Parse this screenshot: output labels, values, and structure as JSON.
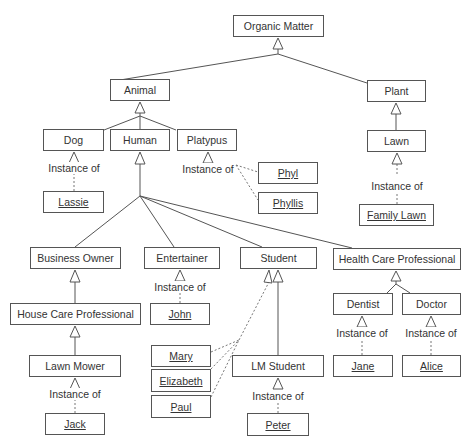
{
  "diagram": {
    "type": "UML class diagram",
    "instance_label": "Instance of",
    "classes": [
      {
        "id": "organic_matter",
        "label": "Organic Matter",
        "x": 233,
        "y": 15,
        "w": 91,
        "h": 22
      },
      {
        "id": "animal",
        "label": "Animal",
        "x": 110,
        "y": 79,
        "w": 60,
        "h": 22
      },
      {
        "id": "plant",
        "label": "Plant",
        "x": 367,
        "y": 80,
        "w": 59,
        "h": 22
      },
      {
        "id": "dog",
        "label": "Dog",
        "x": 43,
        "y": 129,
        "w": 61,
        "h": 22
      },
      {
        "id": "human",
        "label": "Human",
        "x": 110,
        "y": 129,
        "w": 60,
        "h": 22
      },
      {
        "id": "platypus",
        "label": "Platypus",
        "x": 177,
        "y": 129,
        "w": 60,
        "h": 22
      },
      {
        "id": "lawn",
        "label": "Lawn",
        "x": 367,
        "y": 130,
        "w": 59,
        "h": 22
      },
      {
        "id": "business_owner",
        "label": "Business Owner",
        "x": 30,
        "y": 247,
        "w": 91,
        "h": 22
      },
      {
        "id": "entertainer",
        "label": "Entertainer",
        "x": 144,
        "y": 247,
        "w": 76,
        "h": 22
      },
      {
        "id": "student",
        "label": "Student",
        "x": 240,
        "y": 247,
        "w": 77,
        "h": 22
      },
      {
        "id": "health_care_professional",
        "label": "Health Care Professional",
        "x": 333,
        "y": 248,
        "w": 128,
        "h": 22
      },
      {
        "id": "house_care_professional",
        "label": "House Care Professional",
        "x": 10,
        "y": 303,
        "w": 131,
        "h": 22
      },
      {
        "id": "dentist",
        "label": "Dentist",
        "x": 333,
        "y": 293,
        "w": 60,
        "h": 22
      },
      {
        "id": "doctor",
        "label": "Doctor",
        "x": 402,
        "y": 293,
        "w": 59,
        "h": 22
      },
      {
        "id": "lawn_mower",
        "label": "Lawn Mower",
        "x": 29,
        "y": 355,
        "w": 92,
        "h": 22
      },
      {
        "id": "lm_student",
        "label": "LM Student",
        "x": 232,
        "y": 355,
        "w": 92,
        "h": 22
      }
    ],
    "instances": [
      {
        "id": "lassie",
        "label": "Lassie",
        "x": 43,
        "y": 191,
        "w": 61,
        "h": 22
      },
      {
        "id": "phyl",
        "label": "Phyl",
        "x": 258,
        "y": 162,
        "w": 60,
        "h": 22
      },
      {
        "id": "phyllis",
        "label": "Phyllis",
        "x": 258,
        "y": 192,
        "w": 60,
        "h": 22
      },
      {
        "id": "family_lawn",
        "label": "Family Lawn",
        "x": 359,
        "y": 204,
        "w": 75,
        "h": 22
      },
      {
        "id": "john",
        "label": "John",
        "x": 150,
        "y": 303,
        "w": 60,
        "h": 22
      },
      {
        "id": "mary",
        "label": "Mary",
        "x": 151,
        "y": 345,
        "w": 60,
        "h": 22
      },
      {
        "id": "elizabeth",
        "label": "Elizabeth",
        "x": 151,
        "y": 369,
        "w": 60,
        "h": 23
      },
      {
        "id": "paul",
        "label": "Paul",
        "x": 151,
        "y": 395,
        "w": 60,
        "h": 23
      },
      {
        "id": "jane",
        "label": "Jane",
        "x": 333,
        "y": 355,
        "w": 60,
        "h": 22
      },
      {
        "id": "alice",
        "label": "Alice",
        "x": 402,
        "y": 355,
        "w": 59,
        "h": 22
      },
      {
        "id": "jack",
        "label": "Jack",
        "x": 45,
        "y": 413,
        "w": 60,
        "h": 22
      },
      {
        "id": "peter",
        "label": "Peter",
        "x": 247,
        "y": 413,
        "w": 62,
        "h": 23
      }
    ],
    "instance_labels": [
      {
        "of": "dog",
        "text": "Instance of",
        "x": 74,
        "y": 164
      },
      {
        "of": "platypus",
        "text": "Instance of",
        "x": 208,
        "y": 165
      },
      {
        "of": "lawn",
        "text": "Instance of",
        "x": 397,
        "y": 180
      },
      {
        "of": "entertainer",
        "text": "Instance of",
        "x": 180,
        "y": 282
      },
      {
        "of": "dentist",
        "text": "Instance of",
        "x": 362,
        "y": 328
      },
      {
        "of": "doctor",
        "text": "Instance of",
        "x": 431,
        "y": 328
      },
      {
        "of": "lawn_mower",
        "text": "Instance of",
        "x": 75,
        "y": 388
      },
      {
        "of": "lm_student",
        "text": "Instance of",
        "x": 278,
        "y": 390
      }
    ],
    "generalizations": [
      {
        "child": "animal",
        "parent": "organic_matter"
      },
      {
        "child": "plant",
        "parent": "organic_matter"
      },
      {
        "child": "dog",
        "parent": "animal"
      },
      {
        "child": "human",
        "parent": "animal"
      },
      {
        "child": "platypus",
        "parent": "animal"
      },
      {
        "child": "lawn",
        "parent": "plant"
      },
      {
        "child": "business_owner",
        "parent": "human"
      },
      {
        "child": "entertainer",
        "parent": "human"
      },
      {
        "child": "student",
        "parent": "human"
      },
      {
        "child": "health_care_professional",
        "parent": "human"
      },
      {
        "child": "house_care_professional",
        "parent": "business_owner"
      },
      {
        "child": "lawn_mower",
        "parent": "house_care_professional"
      },
      {
        "child": "lm_student",
        "parent": "student"
      },
      {
        "child": "dentist",
        "parent": "health_care_professional"
      },
      {
        "child": "doctor",
        "parent": "health_care_professional"
      }
    ],
    "instantiations": [
      {
        "instance": "lassie",
        "class": "dog"
      },
      {
        "instance": "phyl",
        "class": "platypus"
      },
      {
        "instance": "phyllis",
        "class": "platypus"
      },
      {
        "instance": "family_lawn",
        "class": "lawn"
      },
      {
        "instance": "john",
        "class": "entertainer"
      },
      {
        "instance": "mary",
        "class": "student"
      },
      {
        "instance": "elizabeth",
        "class": "student"
      },
      {
        "instance": "paul",
        "class": "student"
      },
      {
        "instance": "jane",
        "class": "dentist"
      },
      {
        "instance": "alice",
        "class": "doctor"
      },
      {
        "instance": "jack",
        "class": "lawn_mower"
      },
      {
        "instance": "peter",
        "class": "lm_student"
      }
    ],
    "colors": {
      "line": "#555555",
      "text": "#333333",
      "background": "#ffffff"
    }
  }
}
